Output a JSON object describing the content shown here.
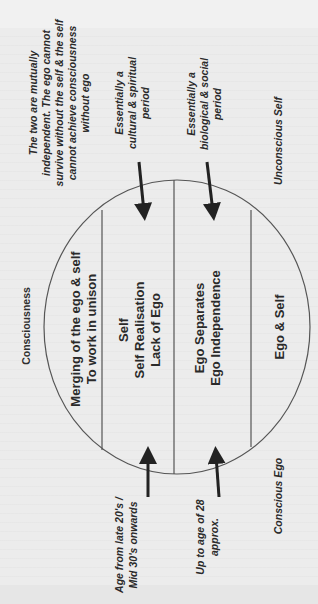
{
  "diagram": {
    "orientation": "rotated -90deg",
    "colors": {
      "background": "#ececec",
      "line": "#444444",
      "arrow": "#222222",
      "text": "#2a2a2a"
    },
    "outer_labels": {
      "consciousness": "Consciousness",
      "unconscious_self": "Unconscious Self",
      "conscious_ego": "Conscious Ego"
    },
    "top_note": {
      "lines": [
        "The two are mutually",
        "independent. The ego cannot",
        "survive without the self  & the self",
        "cannot  achieve consciousness",
        "without ego"
      ]
    },
    "upper_annotations": [
      {
        "lines": [
          "Essentially a",
          "cultural & spiritual",
          "period"
        ]
      },
      {
        "lines": [
          "Essentially a",
          "biological & social",
          "period"
        ]
      }
    ],
    "lower_annotations": [
      {
        "lines": [
          "Age from late 20's /",
          "Mid 30's onwards"
        ]
      },
      {
        "lines": [
          "Up to age of 28",
          "approx."
        ]
      }
    ],
    "sections": [
      {
        "lines": [
          "Merging of the ego & self",
          "To work in unison"
        ]
      },
      {
        "lines": [
          "Self",
          "Self Realisation",
          "Lack of Ego"
        ]
      },
      {
        "lines": [
          "Ego Separates",
          "Ego Independence"
        ]
      },
      {
        "lines": [
          "Ego & Self"
        ]
      }
    ]
  }
}
